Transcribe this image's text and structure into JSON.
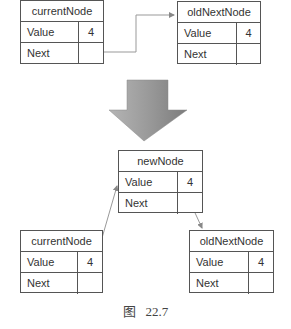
{
  "diagram": {
    "before": {
      "current_node": {
        "title": "currentNode",
        "value_label": "Value",
        "value": "4",
        "next_label": "Next",
        "next_value": ""
      },
      "old_next_node": {
        "title": "oldNextNode",
        "value_label": "Value",
        "value": "4",
        "next_label": "Next",
        "next_value": ""
      }
    },
    "transition_arrow": {
      "direction": "down",
      "color": "#8a8a8a"
    },
    "after": {
      "new_node": {
        "title": "newNode",
        "value_label": "Value",
        "value": "4",
        "next_label": "Next",
        "next_value": ""
      },
      "current_node": {
        "title": "currentNode",
        "value_label": "Value",
        "value": "4",
        "next_label": "Next",
        "next_value": ""
      },
      "old_next_node": {
        "title": "oldNextNode",
        "value_label": "Value",
        "value": "4",
        "next_label": "Next",
        "next_value": ""
      }
    },
    "links": [
      {
        "from": "before.current_node.next",
        "to": "before.old_next_node"
      },
      {
        "from": "after.current_node.next",
        "to": "after.new_node"
      },
      {
        "from": "after.new_node.next",
        "to": "after.old_next_node"
      }
    ],
    "caption": "图   22.7"
  }
}
